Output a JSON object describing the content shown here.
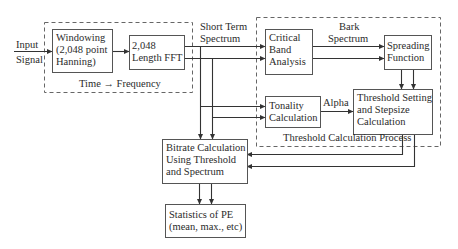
{
  "diagram": {
    "input_label": [
      "Input",
      "Signal"
    ],
    "time_frequency_group": {
      "label": "Time → Frequency",
      "blocks": {
        "windowing": [
          "Windowing",
          "(2,048 point",
          "Hanning)"
        ],
        "fft": [
          "2,048",
          "Length FFT"
        ]
      }
    },
    "short_term_spectrum_label": [
      "Short Term",
      "Spectrum"
    ],
    "threshold_group": {
      "label": "Threshold Calculation Process",
      "bark_spectrum_label": [
        "Bark",
        "Spectrum"
      ],
      "alpha_label": "Alpha",
      "blocks": {
        "critical_band": [
          "Critical",
          "Band",
          "Analysis"
        ],
        "spreading": [
          "Spreading",
          "Function"
        ],
        "tonality": [
          "Tonality",
          "Calculation"
        ],
        "threshold_setting": [
          "Threshold Setting",
          "and Stepsize",
          "Calculation"
        ]
      }
    },
    "bitrate_block": [
      "Bitrate Calculation",
      "Using Threshold",
      "and Spectrum"
    ],
    "statistics_block": [
      "Statistics of PE",
      "(mean, max., etc)"
    ],
    "colors": {
      "line": "#333333",
      "dashed_border": "#555555",
      "background": "#ffffff"
    }
  }
}
